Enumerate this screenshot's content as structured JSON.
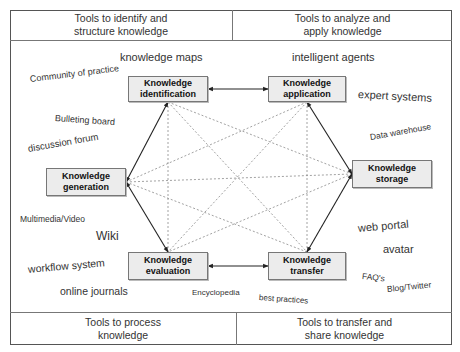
{
  "headers": {
    "top_left": "Tools to identify and structure knowledge",
    "top_left_lines": [
      "Tools to identify and",
      "structure knowledge"
    ],
    "top_right_lines": [
      "Tools to analyze and",
      "apply knowledge"
    ],
    "bottom_left_lines": [
      "Tools to process",
      "knowledge"
    ],
    "bottom_right_lines": [
      "Tools to transfer and",
      "share knowledge"
    ]
  },
  "nodes": {
    "identification": [
      "Knowledge",
      "identification"
    ],
    "application": [
      "Knowledge",
      "application"
    ],
    "generation": [
      "Knowledge",
      "generation"
    ],
    "storage": [
      "Knowledge",
      "storage"
    ],
    "evaluation": [
      "Knowledge",
      "evaluation"
    ],
    "transfer": [
      "Knowledge",
      "transfer"
    ]
  },
  "tools": {
    "knowledge_maps": "knowledge maps",
    "community_of_practice": "Community of practice",
    "bulleting_board": "Bulleting board",
    "discussion_forum": "discussion forum",
    "multimedia_video": "Multimedia/Video",
    "wiki": "Wiki",
    "workflow_system": "workflow system",
    "online_journals": "online journals",
    "encyclopedia": "Encyclopedia",
    "best_practices": "best practices",
    "intelligent_agents": "intelligent agents",
    "expert_systems": "expert systems",
    "data_warehouse": "Data warehouse",
    "web_portal": "web portal",
    "avatar": "avatar",
    "faqs": "FAQ's",
    "blog_twitter": "Blog/Twitter"
  },
  "colors": {
    "frame": "#555555",
    "node_fill": "#ececec",
    "node_border": "#777777",
    "solid_arrow": "#222222",
    "dashed_line": "#888888"
  }
}
